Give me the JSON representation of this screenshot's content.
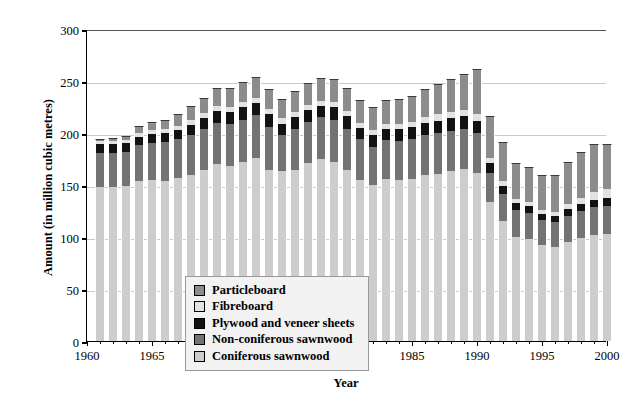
{
  "chart_data": {
    "type": "bar",
    "stacked": true,
    "title": "",
    "xlabel": "Year",
    "ylabel": "Amount (in million cubic metres)",
    "xlim": [
      1960,
      2000
    ],
    "ylim": [
      0,
      300
    ],
    "ytick_values": [
      0,
      50,
      100,
      150,
      200,
      250,
      300
    ],
    "ytick_labels": [
      "0",
      "50",
      "100",
      "150",
      "200",
      "250",
      "300"
    ],
    "xtick_values": [
      1960,
      1965,
      1970,
      1975,
      1980,
      1985,
      1990,
      1995,
      2000
    ],
    "xtick_labels": [
      "1960",
      "1965",
      "1970",
      "1975",
      "1980",
      "1985",
      "1990",
      "1995",
      "2000"
    ],
    "grid": "horizontal",
    "legend_position": "lower-left-inside",
    "categories": [
      1961,
      1962,
      1963,
      1964,
      1965,
      1966,
      1967,
      1968,
      1969,
      1970,
      1971,
      1972,
      1973,
      1974,
      1975,
      1976,
      1977,
      1978,
      1979,
      1980,
      1981,
      1982,
      1983,
      1984,
      1985,
      1986,
      1987,
      1988,
      1989,
      1990,
      1991,
      1992,
      1993,
      1994,
      1995,
      1996,
      1997,
      1998,
      1999,
      2000
    ],
    "series": [
      {
        "name": "Coniferous sawnwood",
        "color": "#cdcdcd",
        "values": [
          148,
          148,
          149,
          154,
          155,
          154,
          157,
          160,
          164,
          170,
          168,
          172,
          176,
          164,
          163,
          164,
          171,
          175,
          172,
          164,
          155,
          150,
          156,
          155,
          156,
          160,
          161,
          163,
          165,
          162,
          134,
          115,
          100,
          98,
          92,
          90,
          95,
          99,
          102,
          103
        ]
      },
      {
        "name": "Non-coniferous sawnwood",
        "color": "#737373",
        "values": [
          33,
          33,
          33,
          34,
          35,
          37,
          37,
          38,
          40,
          40,
          41,
          41,
          41,
          42,
          35,
          40,
          40,
          40,
          41,
          40,
          39,
          37,
          37,
          37,
          38,
          38,
          39,
          39,
          39,
          38,
          28,
          26,
          26,
          25,
          24,
          24,
          25,
          26,
          27,
          27
        ]
      },
      {
        "name": "Plywood and veneer sheets",
        "color": "#121212",
        "values": [
          8,
          8,
          8,
          8,
          9,
          9,
          9,
          10,
          10,
          11,
          11,
          12,
          12,
          12,
          11,
          11,
          11,
          11,
          12,
          12,
          11,
          11,
          11,
          12,
          12,
          12,
          12,
          12,
          12,
          12,
          9,
          8,
          7,
          7,
          6,
          6,
          7,
          7,
          7,
          8
        ]
      },
      {
        "name": "Fibreboard",
        "color": "#e2e2e2",
        "values": [
          3,
          3,
          3,
          4,
          4,
          4,
          4,
          5,
          5,
          5,
          5,
          5,
          5,
          5,
          5,
          5,
          5,
          5,
          5,
          5,
          5,
          5,
          5,
          5,
          5,
          5,
          6,
          6,
          6,
          6,
          5,
          5,
          4,
          4,
          4,
          4,
          5,
          6,
          7,
          8
        ]
      },
      {
        "name": "Particleboard",
        "color": "#8c8c8c",
        "values": [
          2,
          3,
          4,
          7,
          8,
          9,
          11,
          13,
          15,
          17,
          18,
          19,
          20,
          19,
          19,
          20,
          21,
          22,
          22,
          22,
          22,
          22,
          23,
          24,
          25,
          27,
          29,
          32,
          35,
          44,
          40,
          37,
          34,
          33,
          34,
          36,
          40,
          44,
          46,
          43
        ]
      }
    ],
    "totals": [
      194,
      195,
      197,
      207,
      211,
      213,
      218,
      226,
      234,
      243,
      243,
      249,
      254,
      242,
      233,
      240,
      248,
      253,
      252,
      243,
      232,
      225,
      232,
      233,
      236,
      242,
      247,
      252,
      257,
      262,
      216,
      191,
      171,
      167,
      160,
      160,
      172,
      182,
      189,
      189
    ]
  },
  "legend": {
    "items": [
      {
        "label": "Particleboard",
        "color": "#8c8c8c"
      },
      {
        "label": "Fibreboard",
        "color": "#e2e2e2"
      },
      {
        "label": "Plywood and veneer sheets",
        "color": "#121212"
      },
      {
        "label": "Non-coniferous sawnwood",
        "color": "#737373"
      },
      {
        "label": "Coniferous sawnwood",
        "color": "#cdcdcd"
      }
    ]
  }
}
